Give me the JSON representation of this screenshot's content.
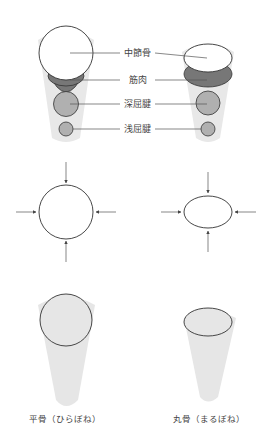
{
  "top_section": {
    "labels": [
      "中節骨",
      "筋肉",
      "深屈腱",
      "浅屈腱"
    ]
  },
  "bottom_section": {
    "captions": [
      "平骨（ひらぼね）",
      "丸骨（まるぼね）"
    ]
  },
  "colors": {
    "cone": "#e6e6e6",
    "bone": "#ffffff",
    "muscle": "#7a7a7a",
    "tendon": "#b4b4b4",
    "stroke": "#333333"
  }
}
